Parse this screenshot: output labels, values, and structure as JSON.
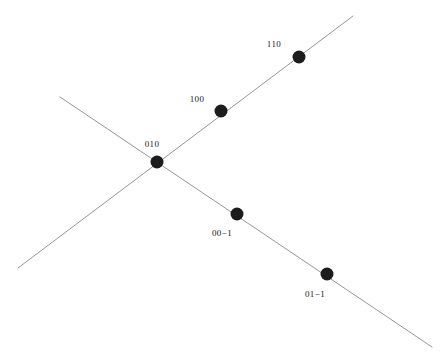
{
  "figure": {
    "background_color": "#ffffff",
    "line_color": "#8a8a8a",
    "dot_color": "#1c1c1c",
    "label_color": "#1a1a1a",
    "width": 448,
    "height": 362
  },
  "chart_data": {
    "type": "scatter",
    "title": "",
    "xlabel": "",
    "ylabel": "",
    "xlim": [
      0,
      448
    ],
    "ylim": [
      0,
      362
    ],
    "grid": false,
    "legend": null,
    "axes_visible": false,
    "lines": [
      {
        "name": "ascending-line",
        "direction": "lower-left to upper-right",
        "x1": 18,
        "y1": 268,
        "x2": 353,
        "y2": 16,
        "color": "#8a8a8a",
        "width": 0.9
      },
      {
        "name": "descending-line",
        "direction": "upper-left to lower-right",
        "x1": 60,
        "y1": 97,
        "x2": 432,
        "y2": 347,
        "color": "#8a8a8a",
        "width": 0.9
      }
    ],
    "points": [
      {
        "label": "110",
        "x": 299,
        "y": 57,
        "line": "ascending-line",
        "label_x": 274,
        "label_y": 45,
        "label_anchor": "middle"
      },
      {
        "label": "100",
        "x": 221,
        "y": 111,
        "line": "ascending-line",
        "label_x": 197,
        "label_y": 100,
        "label_anchor": "middle"
      },
      {
        "label": "010",
        "x": 157,
        "y": 162,
        "line": "intersection",
        "label_x": 152,
        "label_y": 145,
        "label_anchor": "middle"
      },
      {
        "label": "00−1",
        "x": 237,
        "y": 214,
        "line": "descending-line",
        "label_x": 222,
        "label_y": 234,
        "label_anchor": "middle"
      },
      {
        "label": "01−1",
        "x": 327,
        "y": 274,
        "line": "descending-line",
        "label_x": 315,
        "label_y": 295,
        "label_anchor": "middle"
      }
    ],
    "point_radius": 6.5,
    "point_count": 5
  },
  "labels": {
    "p_110": "110",
    "p_100": "100",
    "p_010": "010",
    "p_00m1": "00−1",
    "p_01m1": "01−1"
  }
}
